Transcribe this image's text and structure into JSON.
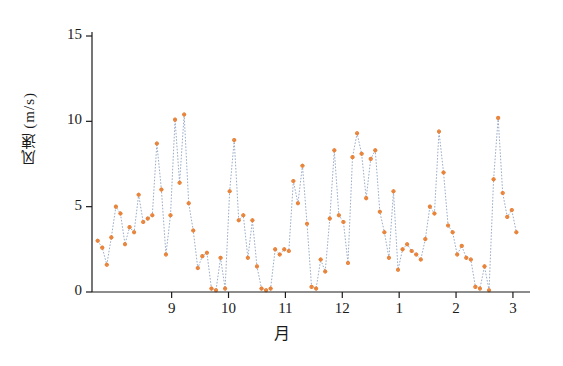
{
  "chart_data": {
    "type": "line",
    "title": "",
    "xlabel": "月",
    "ylabel": "风速 (m/s)",
    "xlim": [
      7.6,
      15.3
    ],
    "ylim": [
      0,
      15
    ],
    "grid": false,
    "legend": null,
    "marker_color": "#e8833a",
    "line_color": "#8fa3c0",
    "line_style": "dotted",
    "y_ticks": [
      {
        "value": 0,
        "label": "0"
      },
      {
        "value": 5,
        "label": "5"
      },
      {
        "value": 10,
        "label": "10"
      },
      {
        "value": 15,
        "label": "15"
      }
    ],
    "x_ticks": [
      {
        "value": 9,
        "label": "9"
      },
      {
        "value": 10,
        "label": "10"
      },
      {
        "value": 11,
        "label": "11"
      },
      {
        "value": 12,
        "label": "12"
      },
      {
        "value": 13,
        "label": "1"
      },
      {
        "value": 14,
        "label": "2"
      },
      {
        "value": 15,
        "label": "3"
      }
    ],
    "x": [
      7.7,
      7.78,
      7.86,
      7.94,
      8.02,
      8.1,
      8.18,
      8.26,
      8.34,
      8.42,
      8.5,
      8.58,
      8.66,
      8.74,
      8.82,
      8.9,
      8.98,
      9.06,
      9.14,
      9.22,
      9.3,
      9.38,
      9.46,
      9.54,
      9.62,
      9.7,
      9.78,
      9.86,
      9.94,
      10.02,
      10.1,
      10.18,
      10.26,
      10.34,
      10.42,
      10.5,
      10.58,
      10.66,
      10.74,
      10.82,
      10.9,
      10.98,
      11.06,
      11.14,
      11.22,
      11.3,
      11.38,
      11.46,
      11.54,
      11.62,
      11.7,
      11.78,
      11.86,
      11.94,
      12.02,
      12.1,
      12.18,
      12.26,
      12.34,
      12.42,
      12.5,
      12.58,
      12.66,
      12.74,
      12.82,
      12.9,
      12.98,
      13.06,
      13.14,
      13.22,
      13.3,
      13.38,
      13.46,
      13.54,
      13.62,
      13.7,
      13.78,
      13.86,
      13.94,
      14.02,
      14.1,
      14.18,
      14.26,
      14.34,
      14.42,
      14.5,
      14.58,
      14.66,
      14.74,
      14.82,
      14.9,
      14.98,
      15.06
    ],
    "y": [
      3.0,
      2.6,
      1.6,
      3.2,
      5.0,
      4.6,
      2.8,
      3.8,
      3.5,
      5.7,
      4.1,
      4.3,
      4.5,
      8.7,
      6.0,
      2.2,
      4.5,
      10.1,
      6.4,
      10.4,
      5.2,
      3.6,
      1.4,
      2.1,
      2.3,
      0.2,
      0.1,
      2.0,
      0.2,
      5.9,
      8.9,
      4.2,
      4.5,
      2.0,
      4.2,
      1.5,
      0.2,
      0.1,
      0.2,
      2.5,
      2.2,
      2.5,
      2.4,
      6.5,
      5.2,
      7.4,
      4.0,
      0.3,
      0.2,
      1.9,
      1.2,
      4.3,
      8.3,
      4.5,
      4.1,
      1.7,
      7.9,
      9.3,
      8.1,
      5.5,
      7.8,
      8.3,
      4.7,
      3.5,
      2.0,
      5.9,
      1.3,
      2.5,
      2.8,
      2.4,
      2.2,
      1.9,
      3.1,
      5.0,
      4.6,
      9.4,
      7.0,
      3.9,
      3.5,
      2.2,
      2.7,
      2.0,
      1.9,
      0.3,
      0.2,
      1.5,
      0.1,
      6.6,
      10.2,
      5.8,
      4.4,
      4.8,
      3.5,
      3.0,
      4.4,
      4.6,
      5.3,
      3.3,
      2.0,
      3.1,
      1.5,
      2.0
    ]
  }
}
